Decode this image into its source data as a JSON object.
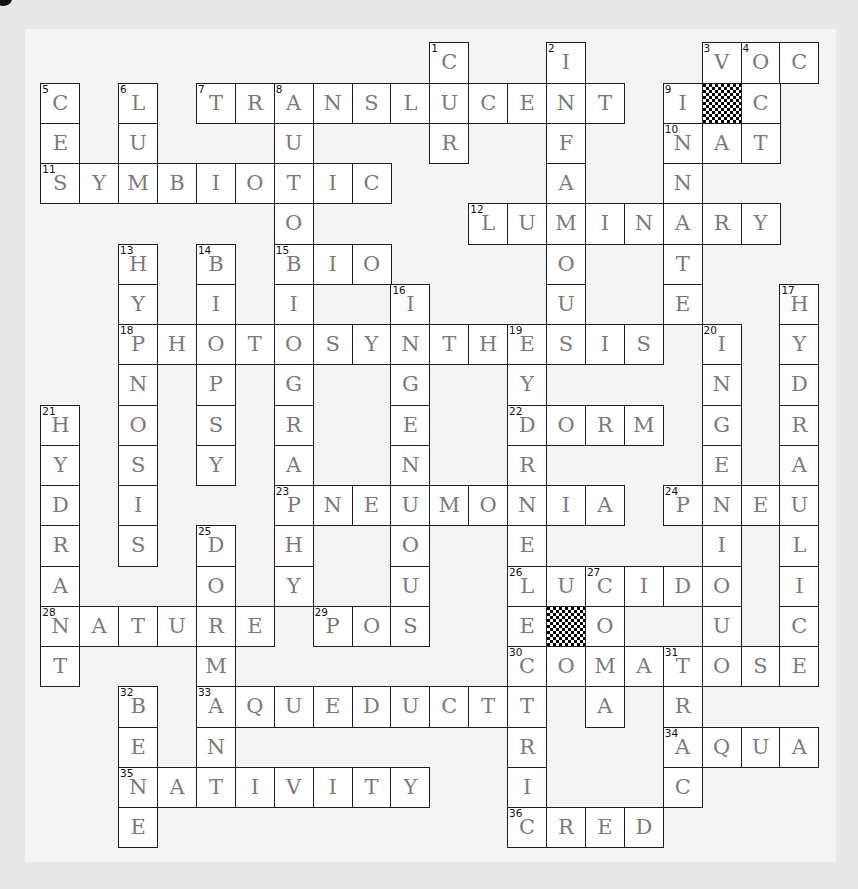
{
  "puzzle": {
    "type": "crossword",
    "rows": 20,
    "cols": 20,
    "colors": {
      "page_background": "#e8e8e8",
      "panel_background": "#f4f4f4",
      "cell_background": "#ffffff",
      "cell_border": "#1e1e1e",
      "letter_color": "#7a7a7a",
      "number_color": "#111111"
    },
    "blocked_cells": [
      {
        "row": 1,
        "col": 17
      },
      {
        "row": 14,
        "col": 13
      }
    ],
    "across": [
      {
        "number": "3",
        "row": 0,
        "col": 17,
        "answer": "VOC"
      },
      {
        "number": "7",
        "row": 1,
        "col": 4,
        "answer": "TRANSLUCENT"
      },
      {
        "number": "10",
        "row": 2,
        "col": 16,
        "answer": "NAT"
      },
      {
        "number": "11",
        "row": 3,
        "col": 0,
        "answer": "SYMBIOTIC"
      },
      {
        "number": "12",
        "row": 4,
        "col": 11,
        "answer": "LUMINARY"
      },
      {
        "number": "15",
        "row": 5,
        "col": 6,
        "answer": "BIO"
      },
      {
        "number": "18",
        "row": 7,
        "col": 2,
        "answer": "PHOTOSYNTHESIS"
      },
      {
        "number": "22",
        "row": 9,
        "col": 12,
        "answer": "DORM"
      },
      {
        "number": "23",
        "row": 11,
        "col": 6,
        "answer": "PNEUMONIA"
      },
      {
        "number": "24",
        "row": 11,
        "col": 16,
        "answer": "PNEU"
      },
      {
        "number": "26",
        "row": 13,
        "col": 12,
        "answer": "LUCID"
      },
      {
        "number": "28",
        "row": 14,
        "col": 0,
        "answer": "NATURE"
      },
      {
        "number": "29",
        "row": 14,
        "col": 7,
        "answer": "POS"
      },
      {
        "number": "30",
        "row": 15,
        "col": 12,
        "answer": "COMATOSE"
      },
      {
        "number": "33",
        "row": 16,
        "col": 4,
        "answer": "AQUEDUCT"
      },
      {
        "number": "34",
        "row": 17,
        "col": 16,
        "answer": "AQUA"
      },
      {
        "number": "35",
        "row": 18,
        "col": 2,
        "answer": "NATIVITY"
      },
      {
        "number": "36",
        "row": 19,
        "col": 12,
        "answer": "CRED"
      }
    ],
    "down": [
      {
        "number": "1",
        "row": 0,
        "col": 10,
        "answer": "CUR"
      },
      {
        "number": "2",
        "row": 0,
        "col": 13,
        "answer": "INFAMOUS"
      },
      {
        "number": "4",
        "row": 0,
        "col": 18,
        "answer": "OCT"
      },
      {
        "number": "5",
        "row": 1,
        "col": 0,
        "answer": "CES"
      },
      {
        "number": "6",
        "row": 1,
        "col": 2,
        "answer": "LUM"
      },
      {
        "number": "8",
        "row": 1,
        "col": 6,
        "answer": "AUTOBIOGRAPHY"
      },
      {
        "number": "9",
        "row": 1,
        "col": 16,
        "answer": "INNATE"
      },
      {
        "number": "13",
        "row": 5,
        "col": 2,
        "answer": "HYPNOSIS"
      },
      {
        "number": "14",
        "row": 5,
        "col": 4,
        "answer": "BIOPSY"
      },
      {
        "number": "16",
        "row": 6,
        "col": 9,
        "answer": "INGENUOUS"
      },
      {
        "number": "17",
        "row": 6,
        "col": 19,
        "answer": "HYDRAULIC"
      },
      {
        "number": "19",
        "row": 7,
        "col": 12,
        "answer": "HYDROELECTRIC"
      },
      {
        "number": "20",
        "row": 7,
        "col": 17,
        "answer": "INGENIOUS"
      },
      {
        "number": "21",
        "row": 9,
        "col": 0,
        "answer": "HYDRANT"
      },
      {
        "number": "25",
        "row": 12,
        "col": 4,
        "answer": "DORMAN"
      },
      {
        "number": "27",
        "row": 13,
        "col": 14,
        "answer": "COMA"
      },
      {
        "number": "31",
        "row": 15,
        "col": 16,
        "answer": "TRAC"
      },
      {
        "number": "32",
        "row": 16,
        "col": 2,
        "answer": "BENE"
      }
    ]
  }
}
